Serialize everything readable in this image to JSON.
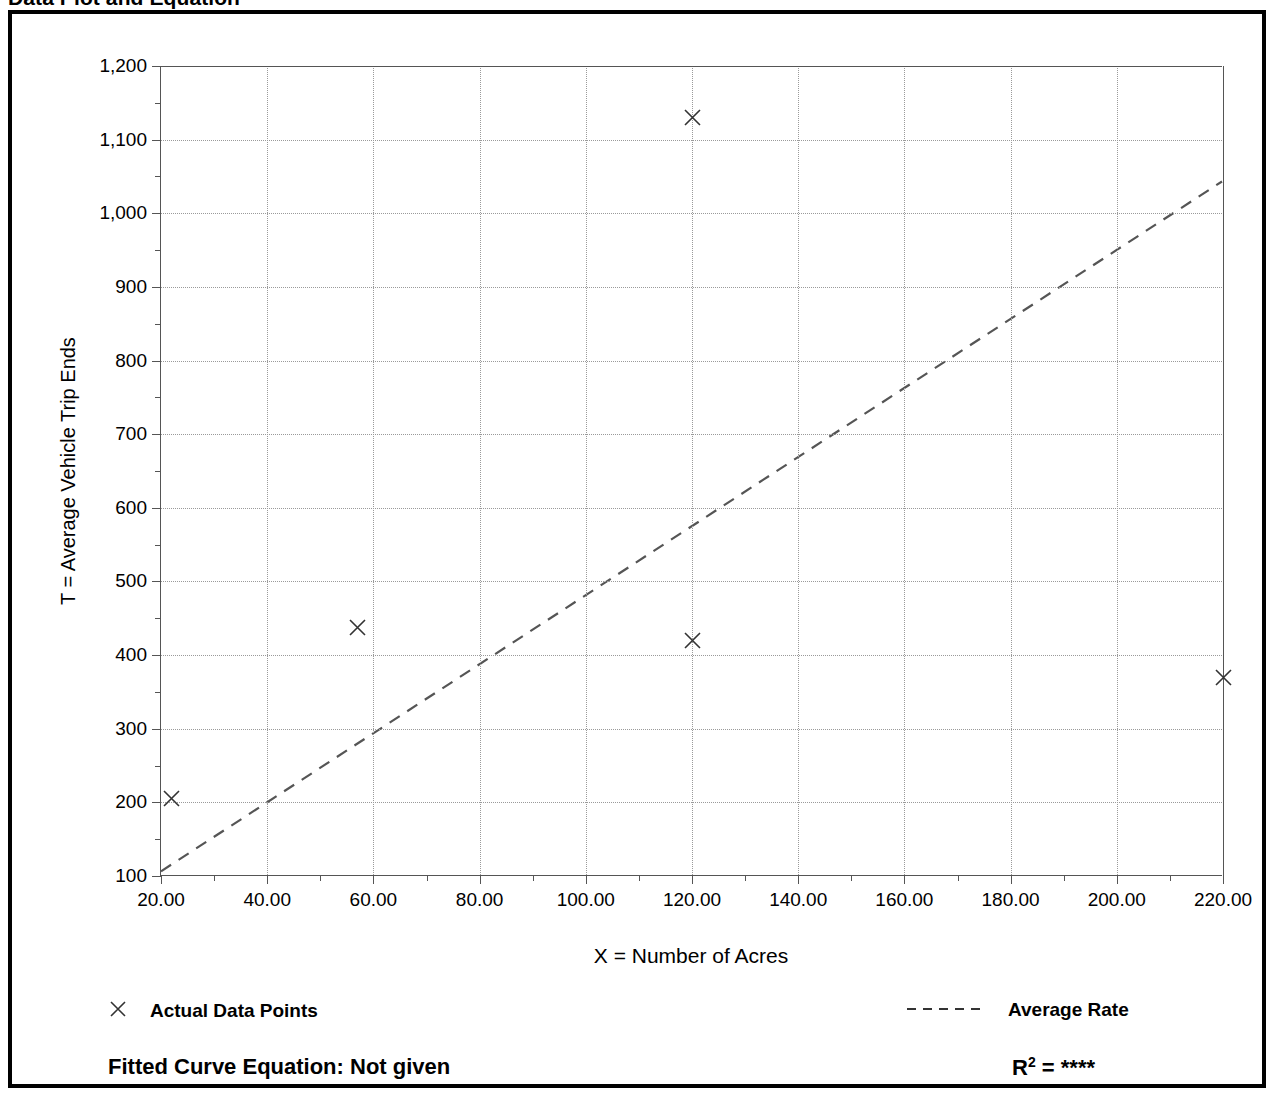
{
  "title": {
    "main": "Data Plot and Equation",
    "right": ""
  },
  "axis_titles": {
    "y": "T = Average Vehicle Trip Ends",
    "x": "X = Number of Acres"
  },
  "legend": {
    "data_points_label": "Actual Data Points",
    "data_points_marker": "x-marker-icon",
    "average_rate_label": "Average Rate",
    "average_rate_marker": "dashed-line-icon"
  },
  "footer": {
    "equation_label": "Fitted Curve Equation:",
    "equation_value": "Not given",
    "equation_full": "Fitted Curve Equation:  Not given",
    "r2_label": "R",
    "r2_superscript": "2",
    "r2_value": "= ****",
    "r2_full": "R2 = ****"
  },
  "chart_data": {
    "type": "scatter",
    "title": "Data Plot and Equation",
    "xlabel": "X = Number of Acres",
    "ylabel": "T = Average Vehicle Trip Ends",
    "xlim": [
      20,
      220
    ],
    "ylim": [
      100,
      1200
    ],
    "xticks": [
      20,
      40,
      60,
      80,
      100,
      120,
      140,
      160,
      180,
      200,
      220
    ],
    "xticklabels": [
      "20.00",
      "40.00",
      "60.00",
      "80.00",
      "100.00",
      "120.00",
      "140.00",
      "160.00",
      "180.00",
      "200.00",
      "220.00"
    ],
    "xtick_minor_step": 10,
    "yticks": [
      100,
      200,
      300,
      400,
      500,
      600,
      700,
      800,
      900,
      1000,
      1100,
      1200
    ],
    "yticklabels": [
      "100",
      "200",
      "300",
      "400",
      "500",
      "600",
      "700",
      "800",
      "900",
      "1,000",
      "1,100",
      "1,200"
    ],
    "ytick_minor_step": 50,
    "grid": true,
    "grid_style": "dotted",
    "legend_position": "below-plot",
    "series": [
      {
        "name": "Actual Data Points",
        "type": "scatter",
        "marker": "x",
        "color": "#333333",
        "points": [
          {
            "x": 22,
            "y": 205
          },
          {
            "x": 57,
            "y": 437
          },
          {
            "x": 120,
            "y": 1130
          },
          {
            "x": 120,
            "y": 420
          },
          {
            "x": 220,
            "y": 370
          }
        ]
      },
      {
        "name": "Average Rate",
        "type": "line",
        "linestyle": "dashed",
        "color": "#555555",
        "endpoints": [
          {
            "x": 20,
            "y": 105
          },
          {
            "x": 220,
            "y": 1043
          }
        ]
      }
    ]
  },
  "colors": {
    "frame": "#000000",
    "grid": "#9a9a9a",
    "axis": "#555555",
    "marker": "#333333",
    "background": "#ffffff"
  }
}
